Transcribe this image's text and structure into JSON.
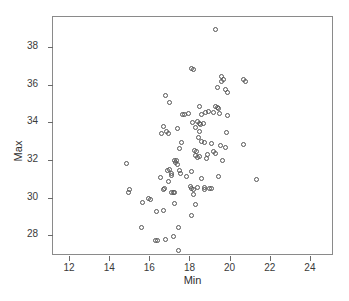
{
  "chart_data": {
    "type": "scatter",
    "title": "",
    "xlabel": "Min",
    "ylabel": "Max",
    "xlim": [
      11.2,
      25.2
    ],
    "ylim": [
      26.9,
      39.6
    ],
    "xticks": [
      12,
      14,
      16,
      18,
      20,
      22,
      24
    ],
    "yticks": [
      28,
      30,
      32,
      34,
      36,
      38
    ],
    "grid": false,
    "legend": null,
    "marker": "open-circle",
    "marker_color": "#555555",
    "n_points": 107,
    "points": [
      [
        19.3,
        38.95
      ],
      [
        18.1,
        36.85
      ],
      [
        18.2,
        36.8
      ],
      [
        19.6,
        36.45
      ],
      [
        19.7,
        36.3
      ],
      [
        19.6,
        36.15
      ],
      [
        20.7,
        36.3
      ],
      [
        20.8,
        36.15
      ],
      [
        19.4,
        35.85
      ],
      [
        19.8,
        35.75
      ],
      [
        19.9,
        35.6
      ],
      [
        16.8,
        35.45
      ],
      [
        17.0,
        35.05
      ],
      [
        18.5,
        34.85
      ],
      [
        19.3,
        34.85
      ],
      [
        19.4,
        34.8
      ],
      [
        19.45,
        34.75
      ],
      [
        18.8,
        34.55
      ],
      [
        19.5,
        34.45
      ],
      [
        19.9,
        34.35
      ],
      [
        17.65,
        34.4
      ],
      [
        17.75,
        34.4
      ],
      [
        18.4,
        34.05
      ],
      [
        18.5,
        33.95
      ],
      [
        18.55,
        33.9
      ],
      [
        18.7,
        33.95
      ],
      [
        18.3,
        33.75
      ],
      [
        16.7,
        33.8
      ],
      [
        16.85,
        33.5
      ],
      [
        16.95,
        33.4
      ],
      [
        18.5,
        33.5
      ],
      [
        19.85,
        33.45
      ],
      [
        18.45,
        33.2
      ],
      [
        18.75,
        32.95
      ],
      [
        17.6,
        32.95
      ],
      [
        20.7,
        32.8
      ],
      [
        19.55,
        32.75
      ],
      [
        18.25,
        32.5
      ],
      [
        18.35,
        32.45
      ],
      [
        17.5,
        32.6
      ],
      [
        19.8,
        32.65
      ],
      [
        18.3,
        32.25
      ],
      [
        18.4,
        32.15
      ],
      [
        18.5,
        32.2
      ],
      [
        19.65,
        32.0
      ],
      [
        17.25,
        32.0
      ],
      [
        17.35,
        31.95
      ],
      [
        17.3,
        31.85
      ],
      [
        17.4,
        31.75
      ],
      [
        14.85,
        31.8
      ],
      [
        18.1,
        31.4
      ],
      [
        17.55,
        31.3
      ],
      [
        17.1,
        31.3
      ],
      [
        16.9,
        31.45
      ],
      [
        18.6,
        31.0
      ],
      [
        19.45,
        31.1
      ],
      [
        21.35,
        30.95
      ],
      [
        17.85,
        31.1
      ],
      [
        17.1,
        31.2
      ],
      [
        16.95,
        30.85
      ],
      [
        15.0,
        30.45
      ],
      [
        14.95,
        30.3
      ],
      [
        16.7,
        30.45
      ],
      [
        18.1,
        30.5
      ],
      [
        18.2,
        30.45
      ],
      [
        19.0,
        30.5
      ],
      [
        19.1,
        30.5
      ],
      [
        18.75,
        30.55
      ],
      [
        17.1,
        30.3
      ],
      [
        17.2,
        30.3
      ],
      [
        17.25,
        30.25
      ],
      [
        18.2,
        30.15
      ],
      [
        15.95,
        29.95
      ],
      [
        16.05,
        29.9
      ],
      [
        15.65,
        29.75
      ],
      [
        17.25,
        29.7
      ],
      [
        18.3,
        29.65
      ],
      [
        16.35,
        29.25
      ],
      [
        16.7,
        29.3
      ],
      [
        18.1,
        29.05
      ],
      [
        15.6,
        28.4
      ],
      [
        17.45,
        28.4
      ],
      [
        16.3,
        27.75
      ],
      [
        16.4,
        27.7
      ],
      [
        16.8,
        27.8
      ],
      [
        17.2,
        27.95
      ],
      [
        17.45,
        27.2
      ],
      [
        18.6,
        33.0
      ],
      [
        19.1,
        32.9
      ],
      [
        18.9,
        32.3
      ],
      [
        18.85,
        32.1
      ],
      [
        17.95,
        34.45
      ],
      [
        18.15,
        34.0
      ],
      [
        18.6,
        34.4
      ],
      [
        18.95,
        34.6
      ],
      [
        19.2,
        34.5
      ],
      [
        16.6,
        33.4
      ],
      [
        17.4,
        33.65
      ],
      [
        17.0,
        31.5
      ],
      [
        18.05,
        30.6
      ],
      [
        18.4,
        30.55
      ],
      [
        17.5,
        31.45
      ],
      [
        16.55,
        31.05
      ],
      [
        19.2,
        32.45
      ],
      [
        19.3,
        32.35
      ],
      [
        16.75,
        30.5
      ],
      [
        18.75,
        30.45
      ]
    ]
  },
  "axes": {
    "y_title": "Max",
    "x_title": "Min",
    "x_tick_labels": [
      "12",
      "14",
      "16",
      "18",
      "20",
      "22",
      "24"
    ],
    "y_tick_labels": [
      "28",
      "30",
      "32",
      "34",
      "36",
      "38"
    ]
  }
}
